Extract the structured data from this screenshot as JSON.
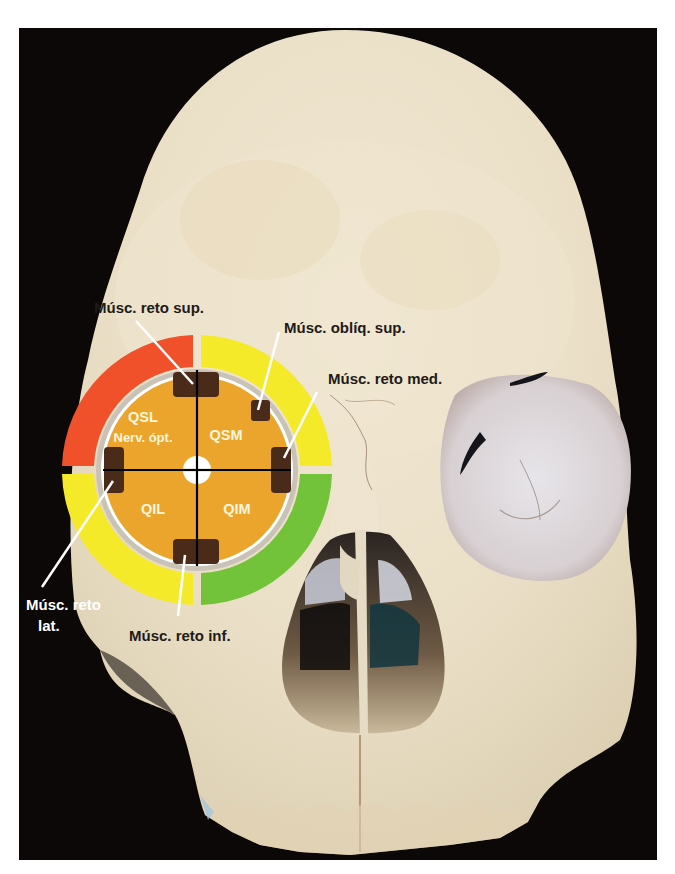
{
  "figure": {
    "background_color": "#0b0807",
    "bone_color": "#efe6d2"
  },
  "diagram": {
    "center": "right orbit",
    "quadrants": {
      "superior_lateral": "QSL",
      "superior_medial": "QSM",
      "inferior_lateral": "QIL",
      "inferior_medial": "QIM"
    },
    "optic_nerve_label": "Nerv. ópt.",
    "colors": {
      "inner_disk": "#eba52c",
      "ring_superior_lateral": "#f0502a",
      "ring_superior_medial": "#f4ea2a",
      "ring_inferior_lateral": "#f4ea2a",
      "ring_inferior_medial": "#72c23a",
      "muscle_insertion": "#4a2a18",
      "quadrant_text": "#fff6dc"
    }
  },
  "labels": {
    "rectus_superior": "Músc. reto sup.",
    "oblique_superior": "Músc. oblíq. sup.",
    "rectus_medial": "Músc. reto med.",
    "rectus_lateral_line1": "Músc. reto",
    "rectus_lateral_line2": "lat.",
    "rectus_inferior": "Músc. reto inf."
  }
}
